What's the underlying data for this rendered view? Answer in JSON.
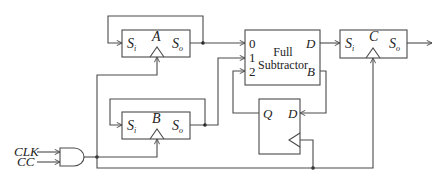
{
  "diagram": {
    "type": "serial subtractor block diagram",
    "inputs": {
      "clk": "CLK",
      "cc": "CC"
    },
    "registers": [
      {
        "id": "A",
        "name": "A",
        "serial_in": "S",
        "serial_in_sub": "i",
        "serial_out": "S",
        "serial_out_sub": "o"
      },
      {
        "id": "B",
        "name": "B",
        "serial_in": "S",
        "serial_in_sub": "i",
        "serial_out": "S",
        "serial_out_sub": "o"
      },
      {
        "id": "C",
        "name": "C",
        "serial_in": "S",
        "serial_in_sub": "i",
        "serial_out": "S",
        "serial_out_sub": "o"
      }
    ],
    "full_subtractor": {
      "title_line1": "Full",
      "title_line2": "Subtractor",
      "inputs": [
        "0",
        "1",
        "2"
      ],
      "output_d": "D",
      "output_b": "B"
    },
    "d_flipflop": {
      "q": "Q",
      "d": "D"
    },
    "gate": "AND",
    "stroke_color": "#4a4a4a",
    "text_color": "#222222",
    "background": "#ffffff"
  }
}
